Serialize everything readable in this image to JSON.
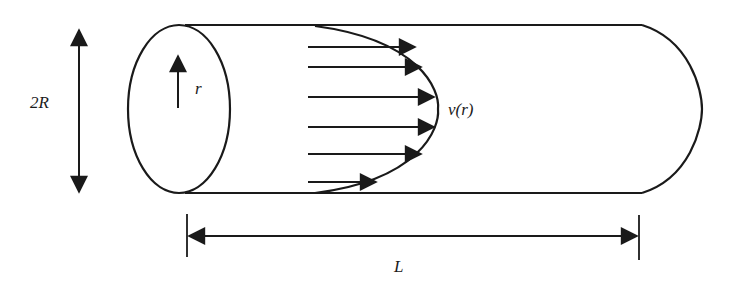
{
  "diagram": {
    "labels": {
      "diameter": "2R",
      "radius": "r",
      "velocity": "v(r)",
      "length": "L"
    },
    "stroke_color": "#1a1a1a",
    "background": "#ffffff",
    "velocity_arrows": [
      {
        "y": 47,
        "x_end": 415
      },
      {
        "y": 67,
        "x_end": 421
      },
      {
        "y": 97,
        "x_end": 432
      },
      {
        "y": 127,
        "x_end": 432
      },
      {
        "y": 154,
        "x_end": 421
      },
      {
        "y": 182,
        "x_end": 374
      }
    ]
  }
}
